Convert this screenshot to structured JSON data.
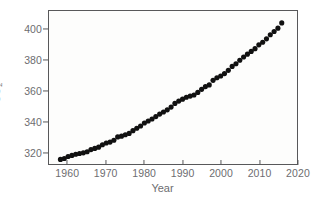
{
  "chart_data": {
    "type": "scatter",
    "title": "",
    "xlabel": "Year",
    "ylabel": "CO2",
    "ylabel_html": "CO<sub>2</sub>",
    "xlim": [
      1955,
      2020
    ],
    "ylim": [
      312,
      412
    ],
    "grid": false,
    "legend": null,
    "marker": "filled-circle",
    "marker_color": "#111111",
    "marker_size_px": 2.6,
    "x_ticks": [
      1960,
      1970,
      1980,
      1990,
      2000,
      2010,
      2020
    ],
    "x_tick_labels": [
      "1960",
      "1970",
      "1980",
      "1990",
      "2000",
      "2010",
      "2020"
    ],
    "y_ticks": [
      320,
      340,
      360,
      380,
      400
    ],
    "y_tick_labels": [
      "320",
      "340",
      "360",
      "380",
      "400"
    ],
    "series_name": "Annual mean atmospheric CO2",
    "x": [
      1958,
      1959,
      1960,
      1961,
      1962,
      1963,
      1964,
      1965,
      1966,
      1967,
      1968,
      1969,
      1970,
      1971,
      1972,
      1973,
      1974,
      1975,
      1976,
      1977,
      1978,
      1979,
      1980,
      1981,
      1982,
      1983,
      1984,
      1985,
      1986,
      1987,
      1988,
      1989,
      1990,
      1991,
      1992,
      1993,
      1994,
      1995,
      1996,
      1997,
      1998,
      1999,
      2000,
      2001,
      2002,
      2003,
      2004,
      2005,
      2006,
      2007,
      2008,
      2009,
      2010,
      2011,
      2012,
      2013,
      2014,
      2015,
      2016
    ],
    "values": [
      315.0,
      315.6,
      316.9,
      317.6,
      318.4,
      318.9,
      319.3,
      320.0,
      321.4,
      322.2,
      323.0,
      324.6,
      325.7,
      326.3,
      327.5,
      329.7,
      330.2,
      331.1,
      332.0,
      333.8,
      335.4,
      336.8,
      338.8,
      340.1,
      341.4,
      343.0,
      344.6,
      346.0,
      347.4,
      349.2,
      351.6,
      353.1,
      354.4,
      355.6,
      356.4,
      357.1,
      358.8,
      360.8,
      362.6,
      363.7,
      366.7,
      368.4,
      369.5,
      371.1,
      373.2,
      375.8,
      377.5,
      379.8,
      381.9,
      383.8,
      385.6,
      387.4,
      389.9,
      391.6,
      393.8,
      396.5,
      398.6,
      400.8,
      404.2
    ]
  },
  "axes": {
    "x_title": "Year",
    "y_title": "CO2"
  }
}
